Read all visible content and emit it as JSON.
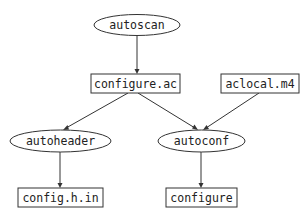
{
  "diagram": {
    "type": "flowchart",
    "nodes": [
      {
        "id": "autoscan",
        "label": "autoscan",
        "shape": "ellipse"
      },
      {
        "id": "configure_ac",
        "label": "configure.ac",
        "shape": "box"
      },
      {
        "id": "aclocal_m4",
        "label": "aclocal.m4",
        "shape": "box"
      },
      {
        "id": "autoheader",
        "label": "autoheader",
        "shape": "ellipse"
      },
      {
        "id": "autoconf",
        "label": "autoconf",
        "shape": "ellipse"
      },
      {
        "id": "config_h_in",
        "label": "config.h.in",
        "shape": "box"
      },
      {
        "id": "configure",
        "label": "configure",
        "shape": "box"
      }
    ],
    "edges": [
      {
        "from": "autoscan",
        "to": "configure_ac"
      },
      {
        "from": "configure_ac",
        "to": "autoheader"
      },
      {
        "from": "configure_ac",
        "to": "autoconf"
      },
      {
        "from": "aclocal_m4",
        "to": "autoconf"
      },
      {
        "from": "autoheader",
        "to": "config_h_in"
      },
      {
        "from": "autoconf",
        "to": "configure"
      }
    ]
  },
  "labels": {
    "autoscan": "autoscan",
    "configure_ac": "configure.ac",
    "aclocal_m4": "aclocal.m4",
    "autoheader": "autoheader",
    "autoconf": "autoconf",
    "config_h_in": "config.h.in",
    "configure": "configure"
  },
  "colors": {
    "stroke": "#333333",
    "text": "#222222",
    "background": "#ffffff"
  }
}
